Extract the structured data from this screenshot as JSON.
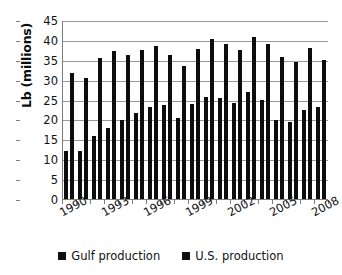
{
  "chart_data": {
    "type": "bar",
    "title": "",
    "xlabel": "",
    "ylabel": "Lb (millions)",
    "ylim": [
      0,
      45
    ],
    "yticks": [
      0,
      5,
      10,
      15,
      20,
      25,
      30,
      35,
      40,
      45
    ],
    "grid": true,
    "legend_position": "bottom",
    "bar_color": "#0d0d0d",
    "gridline_color": "#9a9a9a",
    "axis_color": "#7d7d7d",
    "categories": [
      "1990",
      "1991",
      "1992",
      "1993",
      "1994",
      "1995",
      "1996",
      "1997",
      "1998",
      "1999",
      "2000",
      "2001",
      "2002",
      "2003",
      "2004",
      "2005",
      "2006",
      "2007",
      "2008"
    ],
    "visible_tick_labels": [
      "1990",
      "1993",
      "1996",
      "1999",
      "2002",
      "2005",
      "2008"
    ],
    "series": [
      {
        "name": "Gulf production",
        "values": [
          12.2,
          12.3,
          16.2,
          18.1,
          20.1,
          22.0,
          23.3,
          24.0,
          20.6,
          24.1,
          25.8,
          25.7,
          24.3,
          27.1,
          25.1,
          20.1,
          19.7,
          22.7,
          23.3
        ]
      },
      {
        "name": "U.S. production",
        "values": [
          32.0,
          30.8,
          35.6,
          37.5,
          36.5,
          37.6,
          38.8,
          36.4,
          33.8,
          38.0,
          40.5,
          39.2,
          37.8,
          41.1,
          39.2,
          35.9,
          34.6,
          38.2,
          35.2
        ]
      }
    ]
  },
  "legend": {
    "items": [
      {
        "label": "Gulf production"
      },
      {
        "label": "U.S. production"
      }
    ]
  }
}
